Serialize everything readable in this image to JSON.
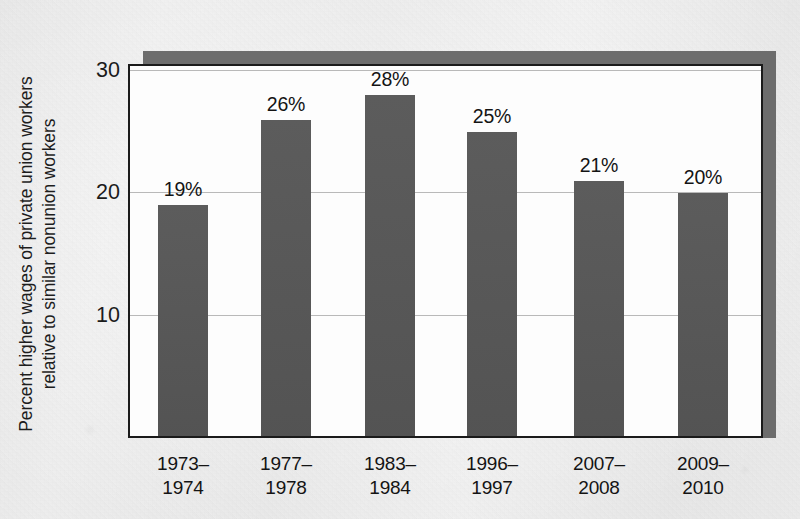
{
  "chart_data": {
    "type": "bar",
    "title": "",
    "xlabel": "",
    "ylabel_line1": "Percent higher wages of private union workers",
    "ylabel_line2": "relative to similar nonunion workers",
    "categories": [
      "1973–1974",
      "1977–1978",
      "1983–1984",
      "1996–1997",
      "2007–2008",
      "2009–2010"
    ],
    "category_lines": [
      [
        "1973–",
        "1974"
      ],
      [
        "1977–",
        "1978"
      ],
      [
        "1983–",
        "1984"
      ],
      [
        "1996–",
        "1997"
      ],
      [
        "2007–",
        "2008"
      ],
      [
        "2009–",
        "2010"
      ]
    ],
    "values": [
      19,
      26,
      28,
      25,
      21,
      20
    ],
    "data_labels": [
      "19%",
      "26%",
      "28%",
      "25%",
      "21%",
      "20%"
    ],
    "ylim": [
      0,
      30.5
    ],
    "yticks": [
      10,
      20,
      30
    ],
    "ytick_labels": [
      "10",
      "20",
      "30"
    ],
    "grid": true,
    "legend": false,
    "legend_position": "none",
    "colors": {
      "bar_fill": "#565656",
      "plot_background": "#fdfdfd",
      "page_background": "#ebebeb",
      "axis": "#1b1b1b",
      "gridline": "#b9b9b9",
      "shadow": "#6d6d6d",
      "text": "#141414"
    }
  }
}
